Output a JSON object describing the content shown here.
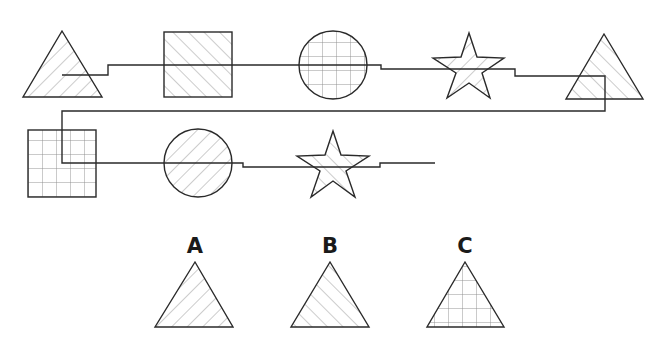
{
  "colors": {
    "stroke": "#2a2a2a",
    "hatch": "#9a9a9a",
    "background": "#ffffff",
    "label": "#1a1a1a"
  },
  "sequence": [
    {
      "shape": "triangle",
      "pattern": "hatch-forward"
    },
    {
      "shape": "square",
      "pattern": "hatch-back"
    },
    {
      "shape": "circle",
      "pattern": "grid"
    },
    {
      "shape": "star",
      "pattern": "hatch-forward"
    },
    {
      "shape": "triangle",
      "pattern": "hatch-back"
    },
    {
      "shape": "square",
      "pattern": "grid"
    },
    {
      "shape": "circle",
      "pattern": "hatch-forward"
    },
    {
      "shape": "star",
      "pattern": "hatch-back"
    }
  ],
  "options": [
    {
      "label": "A",
      "shape": "triangle",
      "pattern": "hatch-forward"
    },
    {
      "label": "B",
      "shape": "triangle",
      "pattern": "hatch-back"
    },
    {
      "label": "C",
      "shape": "triangle",
      "pattern": "grid"
    }
  ]
}
